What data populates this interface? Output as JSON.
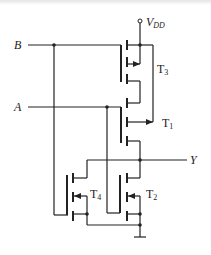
{
  "diagram": {
    "type": "CMOS logic gate schematic",
    "labels": {
      "input_b": "B",
      "input_a": "A",
      "output_y": "Y",
      "supply_main": "V",
      "supply_sub": "DD",
      "t3_main": "T",
      "t3_sub": "3",
      "t1_main": "T",
      "t1_sub": "1",
      "t4_main": "T",
      "t4_sub": "4",
      "t2_main": "T",
      "t2_sub": "2"
    },
    "components": [
      {
        "id": "T3",
        "kind": "PMOS",
        "gate": "B"
      },
      {
        "id": "T1",
        "kind": "PMOS",
        "gate": "A"
      },
      {
        "id": "T4",
        "kind": "NMOS",
        "gate": "B"
      },
      {
        "id": "T2",
        "kind": "NMOS",
        "gate": "A"
      }
    ],
    "colors": {
      "line": "#222222",
      "background": "#ffffff"
    }
  }
}
